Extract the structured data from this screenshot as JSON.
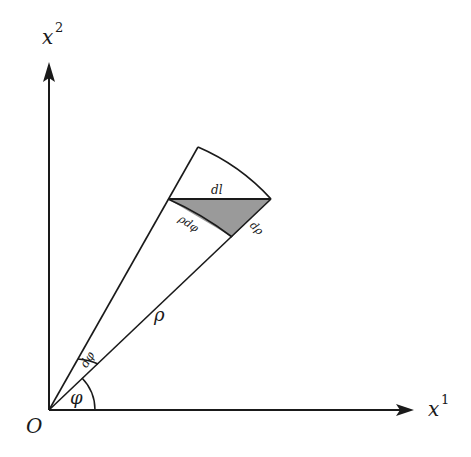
{
  "diagram": {
    "colors": {
      "stroke": "#1a1a1a",
      "shade": "#9a9a9a",
      "background": "#ffffff"
    },
    "axes": {
      "x_label": "x",
      "x_superscript": "1",
      "y_label": "x",
      "y_superscript": "2",
      "origin_label": "O"
    },
    "labels": {
      "rho": "ρ",
      "phi": "φ",
      "dphi": "dφ",
      "dl": "dl",
      "rho_dphi": "ρdφ",
      "drho": "dρ"
    }
  }
}
